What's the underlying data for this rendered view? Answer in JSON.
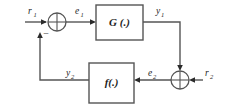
{
  "diagram": {
    "type": "control-system-block-diagram",
    "colors": {
      "background": "#ffffff",
      "wire": "#555555",
      "block_border": "#555555",
      "text": "#1d1d1d",
      "arrowhead": "#2b2b2b"
    },
    "blocks": [
      {
        "id": "forward-block",
        "label": "G (.)",
        "label_base": "G",
        "label_arg": "(.)",
        "x": 96,
        "y": 5,
        "width": 47,
        "height": 35
      },
      {
        "id": "feedback-block",
        "label": "f(.)",
        "label_base": "f",
        "label_arg": "(.)",
        "x": 89,
        "y": 63,
        "width": 45,
        "height": 40
      }
    ],
    "summing_junctions": [
      {
        "id": "input-summer",
        "cx": 57,
        "cy": 22,
        "r": 9,
        "signs": [
          "-"
        ],
        "sign_position": "bottom"
      },
      {
        "id": "output-summer",
        "cx": 180,
        "cy": 80,
        "r": 9,
        "signs": [],
        "sign_position": "none"
      }
    ],
    "signals": [
      {
        "id": "r1",
        "base": "r",
        "sub": "1",
        "x": 28,
        "y": 14
      },
      {
        "id": "e1",
        "base": "e",
        "sub": "1",
        "x": 75,
        "y": 14
      },
      {
        "id": "y1",
        "base": "y",
        "sub": "1",
        "x": 156,
        "y": 14
      },
      {
        "id": "e2",
        "base": "e",
        "sub": "2",
        "x": 148,
        "y": 76
      },
      {
        "id": "r2",
        "base": "r",
        "sub": "2",
        "x": 205,
        "y": 76
      },
      {
        "id": "y2",
        "base": "y",
        "sub": "2",
        "x": 66,
        "y": 74
      }
    ],
    "sign_markers": [
      {
        "id": "minus-sign",
        "text": "−",
        "x": 46,
        "y": 37
      }
    ]
  }
}
